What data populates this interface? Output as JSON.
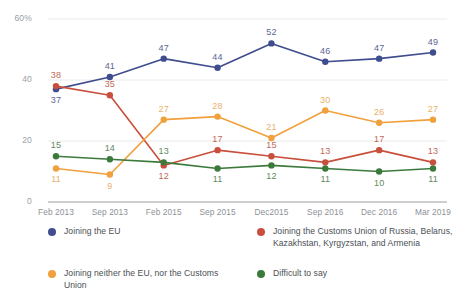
{
  "chart_data": {
    "type": "line",
    "title": "",
    "xlabel": "",
    "ylabel": "",
    "ylim": [
      0,
      60
    ],
    "yticks": [
      "0",
      "20",
      "40",
      "60%"
    ],
    "ytick_values": [
      0,
      20,
      40,
      60
    ],
    "grid": true,
    "legend_position": "bottom",
    "categories": [
      "Feb 2013",
      "Sep 2013",
      "Feb 2015",
      "Sep 2015",
      "Dec2015",
      "Sep 2016",
      "Dec 2016",
      "Mar 2019"
    ],
    "series": [
      {
        "name": "Joining the EU",
        "color": "#3F4D8F",
        "label_color": "#5b6596",
        "values": [
          37,
          41,
          47,
          44,
          52,
          46,
          47,
          49
        ],
        "label_side": [
          "below",
          "above",
          "above",
          "above",
          "above",
          "above",
          "above",
          "above"
        ]
      },
      {
        "name": "Joining the Customs Union of Russia, Belarus, Kazakhstan, Kyrgyzstan, and Armenia",
        "color": "#C94F3D",
        "label_color": "#c06a58",
        "values": [
          38,
          35,
          12,
          17,
          15,
          13,
          17,
          13
        ],
        "label_side": [
          "above",
          "above",
          "below",
          "above",
          "above",
          "above",
          "above",
          "above"
        ]
      },
      {
        "name": "Joining neither the EU, nor the Customs Union",
        "color": "#F0A03C",
        "label_color": "#e8b26a",
        "values": [
          11,
          9,
          27,
          28,
          21,
          30,
          26,
          27
        ],
        "label_side": [
          "below",
          "below",
          "above",
          "above",
          "above",
          "above",
          "above",
          "above"
        ]
      },
      {
        "name": "Difficult to say",
        "color": "#3C7A3C",
        "label_color": "#5e8a5e",
        "values": [
          15,
          14,
          13,
          11,
          12,
          11,
          10,
          11
        ],
        "label_side": [
          "above",
          "above",
          "above",
          "below",
          "below",
          "below",
          "below",
          "below"
        ]
      }
    ]
  },
  "legend": {
    "items": [
      {
        "label": "Joining the EU",
        "color": "#3F4D8F"
      },
      {
        "label": "Joining the Customs Union of Russia, Belarus, Kazakhstan, Kyrgyzstan, and Armenia",
        "color": "#C94F3D"
      },
      {
        "label": "Joining neither the EU, nor the Customs Union",
        "color": "#F0A03C"
      },
      {
        "label": "Difficult to say",
        "color": "#3C7A3C"
      }
    ]
  },
  "footer": {
    "partial_text": ""
  }
}
